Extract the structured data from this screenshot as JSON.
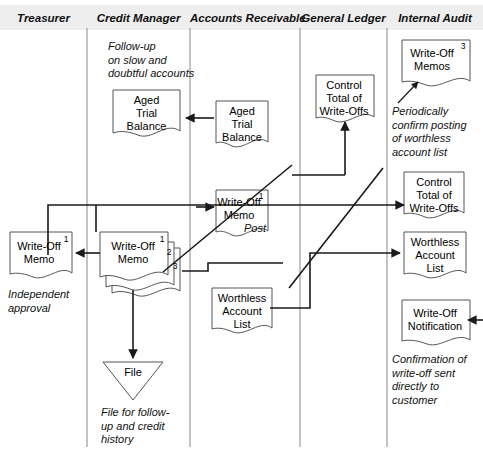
{
  "diagram": {
    "colors": {
      "header_background": "#eeeeee",
      "line": "#1a1a1a",
      "shape_stroke": "#4a4a4a",
      "shape_fill": "#ffffff",
      "text": "#000000"
    },
    "columns": [
      {
        "id": "treasurer",
        "label": "Treasurer"
      },
      {
        "id": "credit-manager",
        "label": "Credit Manager"
      },
      {
        "id": "accounts-receivable",
        "label": "Accounts Receivable"
      },
      {
        "id": "general-ledger",
        "label": "General Ledger"
      },
      {
        "id": "internal-audit",
        "label": "Internal Audit"
      }
    ],
    "documents": [
      {
        "id": "aged-trial-balance-cm",
        "column": "credit-manager",
        "label": "Aged\nTrial\nBalance",
        "copy": ""
      },
      {
        "id": "aged-trial-balance-ar",
        "column": "accounts-receivable",
        "label": "Aged\nTrial\nBalance",
        "copy": ""
      },
      {
        "id": "write-off-memo-ar",
        "column": "accounts-receivable",
        "label": "Write-Off\nMemo",
        "copy": "1"
      },
      {
        "id": "write-off-memo-treasurer",
        "column": "treasurer",
        "label": "Write-Off\nMemo",
        "copy": "1"
      },
      {
        "id": "write-off-memo-stack-cm",
        "column": "credit-manager",
        "label": "Write-Off\nMemo",
        "copy": "1",
        "copy2": "2",
        "copy3": "3"
      },
      {
        "id": "worthless-account-list-ar",
        "column": "accounts-receivable",
        "label": "Worthless\nAccount\nList",
        "copy": ""
      },
      {
        "id": "control-total-write-offs-gl",
        "column": "general-ledger",
        "label": "Control\nTotal of\nWrite-Offs",
        "copy": ""
      },
      {
        "id": "write-off-memos-ia",
        "column": "internal-audit",
        "label": "Write-Off\nMemos",
        "copy": "3"
      },
      {
        "id": "control-total-write-offs-ia",
        "column": "internal-audit",
        "label": "Control\nTotal of\nWrite-Offs",
        "copy": ""
      },
      {
        "id": "worthless-account-list-ia",
        "column": "internal-audit",
        "label": "Worthless\nAccount\nList",
        "copy": ""
      },
      {
        "id": "write-off-notification-ia",
        "column": "internal-audit",
        "label": "Write-Off\nNotification",
        "copy": ""
      }
    ],
    "file_shape": {
      "id": "file-triangle",
      "column": "credit-manager",
      "label": "File"
    },
    "notes": [
      {
        "id": "note-follow-up",
        "text": "Follow-up\non slow and\ndoubtful accounts"
      },
      {
        "id": "note-independent-approval",
        "text": "Independent\napproval"
      },
      {
        "id": "note-post",
        "text": "Post"
      },
      {
        "id": "note-file-for-follow-up",
        "text": "File for follow-\nup and credit\nhistory"
      },
      {
        "id": "note-periodically-confirm",
        "text": "Periodically\nconfirm posting\nof worthless\naccount list"
      },
      {
        "id": "note-confirmation",
        "text": "Confirmation of\nwrite-off sent\ndirectly to\ncustomer"
      }
    ]
  }
}
